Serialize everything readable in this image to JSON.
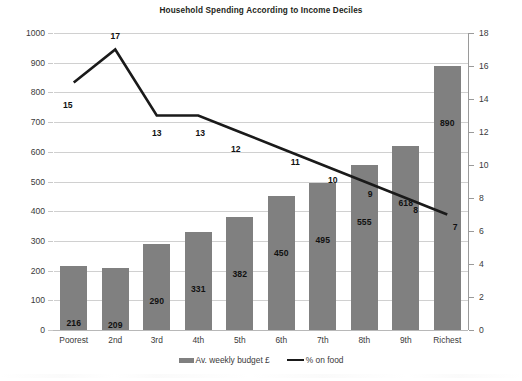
{
  "chart_data": {
    "type": "bar",
    "title": "Household Spending According to Income Deciles",
    "xlabel": "",
    "ylabel": "",
    "categories": [
      "Poorest",
      "2nd",
      "3rd",
      "4th",
      "5th",
      "6th",
      "7th",
      "8th",
      "9th",
      "Richest"
    ],
    "series": [
      {
        "name": "Av. weekly budget £",
        "type": "bar",
        "axis": "left",
        "values": [
          216,
          209,
          290,
          331,
          382,
          450,
          495,
          555,
          618,
          890
        ],
        "color": "#808080"
      },
      {
        "name": "% on food",
        "type": "line",
        "axis": "right",
        "values": [
          15,
          17,
          13,
          13,
          12,
          11,
          10,
          9,
          8,
          7
        ],
        "color": "#1a1a1a"
      }
    ],
    "ylim": [
      0,
      1000
    ],
    "y2lim": [
      0,
      18
    ],
    "yticks": [
      0,
      100,
      200,
      300,
      400,
      500,
      600,
      700,
      800,
      900,
      1000
    ],
    "y2ticks": [
      0,
      2,
      4,
      6,
      8,
      10,
      12,
      14,
      16,
      18
    ],
    "grid": true,
    "legend_position": "bottom"
  },
  "axes": {
    "left_ticks": [
      "1000",
      "900",
      "800",
      "700",
      "600",
      "500",
      "400",
      "300",
      "200",
      "100",
      "0"
    ],
    "right_ticks": [
      "18",
      "16",
      "14",
      "12",
      "10",
      "8",
      "6",
      "4",
      "2",
      "0"
    ]
  },
  "legend": {
    "items": [
      {
        "label": "Av. weekly budget £",
        "marker": "bar-swatch"
      },
      {
        "label": "% on food",
        "marker": "line-swatch"
      }
    ]
  }
}
